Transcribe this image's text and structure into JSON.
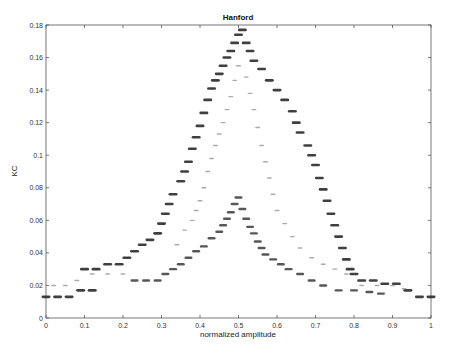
{
  "chart_data": {
    "type": "scatter",
    "title": "Hanford",
    "xlabel": "normalized amplitude",
    "ylabel": "KC",
    "xlim": [
      0,
      1
    ],
    "ylim": [
      0,
      0.18
    ],
    "xticks": [
      "0",
      "0.1",
      "0.2",
      "0.3",
      "0.4",
      "0.5",
      "0.6",
      "0.7",
      "0.8",
      "0.9",
      "1"
    ],
    "yticks": [
      "0",
      "0.02",
      "0.04",
      "0.06",
      "0.08",
      "0.1",
      "0.12",
      "0.14",
      "0.16",
      "0.18"
    ],
    "grid": false,
    "legend": null,
    "series": [
      {
        "name": "outer",
        "marker": "dark-dense",
        "points": [
          [
            0.0,
            0.013
          ],
          [
            0.03,
            0.013
          ],
          [
            0.06,
            0.013
          ],
          [
            0.09,
            0.017
          ],
          [
            0.12,
            0.017
          ],
          [
            0.1,
            0.03
          ],
          [
            0.13,
            0.03
          ],
          [
            0.16,
            0.033
          ],
          [
            0.19,
            0.033
          ],
          [
            0.21,
            0.037
          ],
          [
            0.23,
            0.041
          ],
          [
            0.25,
            0.045
          ],
          [
            0.27,
            0.048
          ],
          [
            0.29,
            0.052
          ],
          [
            0.3,
            0.058
          ],
          [
            0.31,
            0.064
          ],
          [
            0.32,
            0.07
          ],
          [
            0.33,
            0.076
          ],
          [
            0.35,
            0.084
          ],
          [
            0.36,
            0.09
          ],
          [
            0.37,
            0.096
          ],
          [
            0.38,
            0.104
          ],
          [
            0.39,
            0.111
          ],
          [
            0.4,
            0.118
          ],
          [
            0.41,
            0.126
          ],
          [
            0.42,
            0.134
          ],
          [
            0.43,
            0.141
          ],
          [
            0.44,
            0.146
          ],
          [
            0.45,
            0.15
          ],
          [
            0.46,
            0.155
          ],
          [
            0.47,
            0.16
          ],
          [
            0.48,
            0.164
          ],
          [
            0.49,
            0.169
          ],
          [
            0.5,
            0.174
          ],
          [
            0.51,
            0.177
          ],
          [
            0.52,
            0.169
          ],
          [
            0.53,
            0.164
          ],
          [
            0.54,
            0.158
          ],
          [
            0.56,
            0.153
          ],
          [
            0.58,
            0.146
          ],
          [
            0.6,
            0.14
          ],
          [
            0.62,
            0.134
          ],
          [
            0.64,
            0.127
          ],
          [
            0.65,
            0.12
          ],
          [
            0.66,
            0.114
          ],
          [
            0.68,
            0.106
          ],
          [
            0.69,
            0.1
          ],
          [
            0.7,
            0.094
          ],
          [
            0.71,
            0.086
          ],
          [
            0.72,
            0.079
          ],
          [
            0.73,
            0.072
          ],
          [
            0.74,
            0.064
          ],
          [
            0.75,
            0.057
          ],
          [
            0.76,
            0.05
          ],
          [
            0.77,
            0.043
          ],
          [
            0.78,
            0.036
          ],
          [
            0.79,
            0.03
          ],
          [
            0.8,
            0.027
          ],
          [
            0.82,
            0.023
          ],
          [
            0.85,
            0.023
          ],
          [
            0.88,
            0.021
          ],
          [
            0.91,
            0.021
          ],
          [
            0.94,
            0.017
          ],
          [
            0.97,
            0.013
          ],
          [
            1.0,
            0.013
          ]
        ]
      },
      {
        "name": "inner",
        "marker": "dark-medium",
        "points": [
          [
            0.23,
            0.023
          ],
          [
            0.26,
            0.023
          ],
          [
            0.29,
            0.023
          ],
          [
            0.31,
            0.027
          ],
          [
            0.33,
            0.03
          ],
          [
            0.35,
            0.033
          ],
          [
            0.37,
            0.037
          ],
          [
            0.39,
            0.041
          ],
          [
            0.41,
            0.044
          ],
          [
            0.43,
            0.049
          ],
          [
            0.45,
            0.053
          ],
          [
            0.46,
            0.057
          ],
          [
            0.47,
            0.061
          ],
          [
            0.48,
            0.065
          ],
          [
            0.49,
            0.07
          ],
          [
            0.5,
            0.074
          ],
          [
            0.51,
            0.067
          ],
          [
            0.52,
            0.061
          ],
          [
            0.53,
            0.056
          ],
          [
            0.54,
            0.052
          ],
          [
            0.55,
            0.047
          ],
          [
            0.56,
            0.043
          ],
          [
            0.57,
            0.039
          ],
          [
            0.59,
            0.036
          ],
          [
            0.61,
            0.033
          ],
          [
            0.63,
            0.03
          ],
          [
            0.66,
            0.027
          ],
          [
            0.69,
            0.023
          ],
          [
            0.72,
            0.02
          ],
          [
            0.76,
            0.017
          ],
          [
            0.8,
            0.017
          ],
          [
            0.84,
            0.016
          ],
          [
            0.87,
            0.015
          ]
        ]
      },
      {
        "name": "faint",
        "marker": "light-small",
        "points": [
          [
            0.02,
            0.02
          ],
          [
            0.05,
            0.02
          ],
          [
            0.08,
            0.023
          ],
          [
            0.12,
            0.027
          ],
          [
            0.16,
            0.027
          ],
          [
            0.2,
            0.027
          ],
          [
            0.34,
            0.045
          ],
          [
            0.36,
            0.054
          ],
          [
            0.38,
            0.06
          ],
          [
            0.39,
            0.066
          ],
          [
            0.4,
            0.072
          ],
          [
            0.41,
            0.08
          ],
          [
            0.42,
            0.09
          ],
          [
            0.43,
            0.098
          ],
          [
            0.44,
            0.106
          ],
          [
            0.45,
            0.113
          ],
          [
            0.46,
            0.12
          ],
          [
            0.47,
            0.128
          ],
          [
            0.48,
            0.136
          ],
          [
            0.49,
            0.146
          ],
          [
            0.5,
            0.155
          ],
          [
            0.52,
            0.148
          ],
          [
            0.53,
            0.138
          ],
          [
            0.54,
            0.128
          ],
          [
            0.55,
            0.117
          ],
          [
            0.56,
            0.106
          ],
          [
            0.57,
            0.096
          ],
          [
            0.58,
            0.086
          ],
          [
            0.59,
            0.076
          ],
          [
            0.6,
            0.066
          ],
          [
            0.62,
            0.058
          ],
          [
            0.64,
            0.05
          ],
          [
            0.66,
            0.043
          ],
          [
            0.69,
            0.037
          ],
          [
            0.72,
            0.033
          ],
          [
            0.75,
            0.03
          ],
          [
            0.78,
            0.027
          ],
          [
            0.82,
            0.02
          ],
          [
            0.86,
            0.02
          ],
          [
            0.9,
            0.02
          ],
          [
            0.93,
            0.018
          ]
        ]
      }
    ]
  }
}
